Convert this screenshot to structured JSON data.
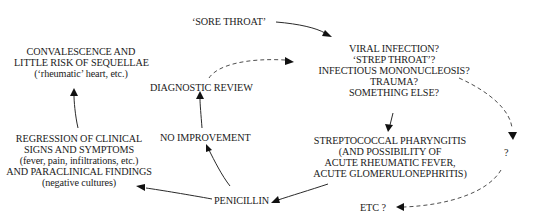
{
  "diagram": {
    "nodes": {
      "sore_throat": {
        "lines": [
          "‘SORE THROAT’"
        ]
      },
      "differential": {
        "lines": [
          "VIRAL INFECTION?",
          "‘STREP THROAT’?",
          "INFECTIOUS MONONUCLEOSIS?",
          "TRAUMA?",
          "SOMETHING ELSE?"
        ]
      },
      "strep": {
        "lines": [
          "STREPTOCOCCAL PHARYNGITIS",
          "(AND POSSIBILITY OF",
          "ACUTE RHEUMATIC FEVER,",
          "ACUTE GLOMERULONEPHRITIS)"
        ]
      },
      "question": {
        "lines": [
          "?"
        ]
      },
      "etc": {
        "lines": [
          "ETC ?"
        ]
      },
      "penicillin": {
        "lines": [
          "PENICILLIN"
        ]
      },
      "regression": {
        "lines": [
          "REGRESSION OF CLINICAL",
          "SIGNS AND SYMPTOMS",
          "(fever, pain, infiltrations, etc.)",
          "AND PARACLINICAL FINDINGS",
          "(negative cultures)"
        ]
      },
      "no_improvement": {
        "lines": [
          "NO IMPROVEMENT"
        ]
      },
      "diagnostic_review": {
        "lines": [
          "DIAGNOSTIC REVIEW"
        ]
      },
      "convalescence": {
        "lines": [
          "CONVALESCENCE AND",
          "LITTLE RISK OF SEQUELLAE",
          "(‘rheumatic’ heart, etc.)"
        ]
      }
    },
    "edges": [
      {
        "from": "sore_throat",
        "to": "differential",
        "style": "solid"
      },
      {
        "from": "differential",
        "to": "strep",
        "style": "solid"
      },
      {
        "from": "differential",
        "to": "question",
        "style": "dashed"
      },
      {
        "from": "question",
        "to": "etc",
        "style": "dashed"
      },
      {
        "from": "strep",
        "to": "penicillin",
        "style": "solid"
      },
      {
        "from": "penicillin",
        "to": "regression",
        "style": "solid"
      },
      {
        "from": "penicillin",
        "to": "no_improvement",
        "style": "solid"
      },
      {
        "from": "regression",
        "to": "convalescence",
        "style": "solid"
      },
      {
        "from": "no_improvement",
        "to": "diagnostic_review",
        "style": "solid"
      },
      {
        "from": "diagnostic_review",
        "to": "differential",
        "style": "dashed"
      }
    ]
  }
}
